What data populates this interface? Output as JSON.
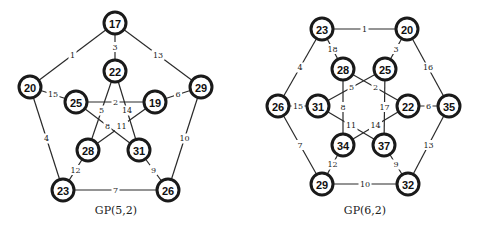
{
  "graphs": [
    {
      "caption": "GP(5,2)",
      "caption_pos": [
        116,
        214
      ],
      "nodes": [
        {
          "id": "17",
          "x": 115,
          "y": 23
        },
        {
          "id": "20",
          "x": 30,
          "y": 87
        },
        {
          "id": "22",
          "x": 115,
          "y": 71
        },
        {
          "id": "25",
          "x": 76,
          "y": 102
        },
        {
          "id": "19",
          "x": 155,
          "y": 102
        },
        {
          "id": "29",
          "x": 201,
          "y": 87
        },
        {
          "id": "28",
          "x": 88,
          "y": 150
        },
        {
          "id": "31",
          "x": 139,
          "y": 150
        },
        {
          "id": "23",
          "x": 63,
          "y": 190
        },
        {
          "id": "26",
          "x": 168,
          "y": 190
        }
      ],
      "edges": [
        {
          "from": "17",
          "to": "20",
          "label": "1"
        },
        {
          "from": "17",
          "to": "22",
          "label": "3"
        },
        {
          "from": "17",
          "to": "29",
          "label": "13"
        },
        {
          "from": "20",
          "to": "25",
          "label": "15"
        },
        {
          "from": "25",
          "to": "19",
          "label": "2"
        },
        {
          "from": "19",
          "to": "29",
          "label": "6"
        },
        {
          "from": "22",
          "to": "28",
          "label": "5"
        },
        {
          "from": "22",
          "to": "31",
          "label": "14"
        },
        {
          "from": "25",
          "to": "31",
          "label": "8"
        },
        {
          "from": "19",
          "to": "28",
          "label": "11"
        },
        {
          "from": "20",
          "to": "23",
          "label": "4"
        },
        {
          "from": "29",
          "to": "26",
          "label": "10"
        },
        {
          "from": "28",
          "to": "23",
          "label": "12"
        },
        {
          "from": "31",
          "to": "26",
          "label": "9"
        },
        {
          "from": "23",
          "to": "26",
          "label": "7"
        }
      ]
    },
    {
      "caption": "GP(6,2)",
      "caption_pos": [
        365,
        214
      ],
      "nodes": [
        {
          "id": "23",
          "x": 322,
          "y": 29
        },
        {
          "id": "20",
          "x": 407,
          "y": 29
        },
        {
          "id": "28",
          "x": 343,
          "y": 69
        },
        {
          "id": "25",
          "x": 385,
          "y": 69
        },
        {
          "id": "26",
          "x": 278,
          "y": 106
        },
        {
          "id": "31",
          "x": 318,
          "y": 106
        },
        {
          "id": "22",
          "x": 408,
          "y": 106
        },
        {
          "id": "35",
          "x": 449,
          "y": 106
        },
        {
          "id": "34",
          "x": 343,
          "y": 145
        },
        {
          "id": "37",
          "x": 384,
          "y": 145
        },
        {
          "id": "29",
          "x": 322,
          "y": 184
        },
        {
          "id": "32",
          "x": 408,
          "y": 184
        }
      ],
      "edges": [
        {
          "from": "23",
          "to": "20",
          "label": "1"
        },
        {
          "from": "23",
          "to": "28",
          "label": "18"
        },
        {
          "from": "20",
          "to": "25",
          "label": "3"
        },
        {
          "from": "23",
          "to": "26",
          "label": "4"
        },
        {
          "from": "20",
          "to": "35",
          "label": "16"
        },
        {
          "from": "28",
          "to": "22",
          "label": "2"
        },
        {
          "from": "25",
          "to": "31",
          "label": "5"
        },
        {
          "from": "26",
          "to": "31",
          "label": "15"
        },
        {
          "from": "22",
          "to": "35",
          "label": "6"
        },
        {
          "from": "28",
          "to": "34",
          "label": "8"
        },
        {
          "from": "25",
          "to": "37",
          "label": "17"
        },
        {
          "from": "31",
          "to": "37",
          "label": "11"
        },
        {
          "from": "22",
          "to": "34",
          "label": "14"
        },
        {
          "from": "26",
          "to": "29",
          "label": "7"
        },
        {
          "from": "35",
          "to": "32",
          "label": "13"
        },
        {
          "from": "34",
          "to": "29",
          "label": "12"
        },
        {
          "from": "37",
          "to": "32",
          "label": "9"
        },
        {
          "from": "29",
          "to": "32",
          "label": "10"
        }
      ]
    }
  ]
}
